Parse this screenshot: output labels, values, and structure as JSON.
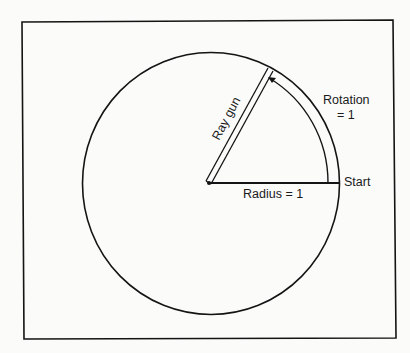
{
  "diagram": {
    "labels": {
      "ray_gun": "Ray gun",
      "rotation_line1": "Rotation",
      "rotation_line2": "= 1",
      "start": "Start",
      "radius": "Radius = 1"
    },
    "geometry": {
      "frame": {
        "x": 22,
        "y": 21,
        "width": 373,
        "height": 317
      },
      "circle": {
        "cx": 211,
        "cy": 183.5,
        "rx": 128.5,
        "ry": 131
      },
      "center_point": {
        "x": 209,
        "y": 183
      },
      "ray_gun_angle_deg": 62,
      "rotation_arc_radius": 119
    },
    "colors": {
      "stroke": "#141414",
      "background": "#fbfbfa"
    }
  }
}
